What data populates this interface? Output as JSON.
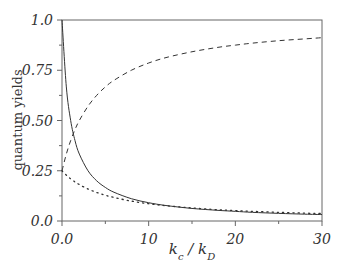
{
  "chart_data": {
    "type": "line",
    "title": "",
    "xlabel": "k_c / k_D",
    "ylabel": "quantum yields",
    "xlim": [
      0,
      30
    ],
    "ylim": [
      0,
      1.0
    ],
    "grid": false,
    "legend": null,
    "x_ticks": [
      0,
      10,
      20,
      30
    ],
    "x_tick_labels": [
      "0.0",
      "10",
      "20",
      "30"
    ],
    "x_minor_ticks": [
      5,
      15,
      25
    ],
    "y_ticks": [
      0,
      0.25,
      0.5,
      0.75,
      1.0
    ],
    "y_tick_labels": [
      "0.0",
      "0.25",
      "0.50",
      "0.75",
      "1.0"
    ],
    "y_minor_ticks": [
      0.125,
      0.375,
      0.625,
      0.875
    ],
    "x": [
      0,
      0.5,
      1,
      1.5,
      2,
      3,
      4,
      5,
      6,
      8,
      10,
      12,
      15,
      18,
      20,
      22,
      25,
      28,
      30
    ],
    "series": [
      {
        "name": "solid",
        "style": "solid",
        "values": [
          1.0,
          0.667,
          0.5,
          0.4,
          0.333,
          0.25,
          0.2,
          0.167,
          0.143,
          0.111,
          0.091,
          0.077,
          0.0625,
          0.053,
          0.048,
          0.043,
          0.038,
          0.034,
          0.032
        ]
      },
      {
        "name": "dashed",
        "style": "dashed",
        "values": [
          0.25,
          0.333,
          0.4,
          0.455,
          0.5,
          0.571,
          0.625,
          0.667,
          0.7,
          0.75,
          0.786,
          0.813,
          0.842,
          0.864,
          0.875,
          0.885,
          0.897,
          0.906,
          0.912
        ]
      },
      {
        "name": "dotted",
        "style": "dotted",
        "values": [
          0.25,
          0.228,
          0.21,
          0.194,
          0.181,
          0.159,
          0.142,
          0.128,
          0.117,
          0.099,
          0.086,
          0.076,
          0.065,
          0.056,
          0.052,
          0.048,
          0.043,
          0.039,
          0.037
        ]
      }
    ]
  },
  "axes": {
    "ylabel": "quantum yields",
    "xlabel_main": "k",
    "xlabel_sub1": "c",
    "xlabel_sep": " / k",
    "xlabel_sub2": "D"
  }
}
